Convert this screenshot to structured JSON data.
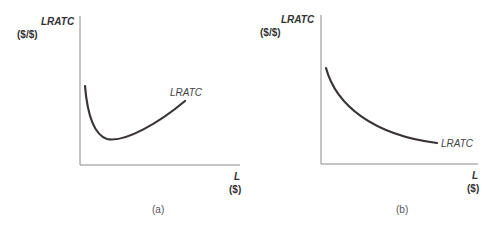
{
  "figure": {
    "panels": [
      {
        "id": "a",
        "caption": "(a)",
        "y_axis": {
          "title": "LRATC",
          "unit": "($/$)"
        },
        "x_axis": {
          "title": "L",
          "unit": "($)"
        },
        "curve_label": "LRATC",
        "curve_shape": "U-shaped (falls steeply then rises)"
      },
      {
        "id": "b",
        "caption": "(b)",
        "y_axis": {
          "title": "LRATC",
          "unit": "($/$)"
        },
        "x_axis": {
          "title": "L",
          "unit": "($)"
        },
        "curve_label": "LRATC",
        "curve_shape": "Continuously declining"
      }
    ]
  },
  "colors": {
    "axis": "#8a8a8a",
    "curve": "#3a3434",
    "text": "#333333"
  }
}
